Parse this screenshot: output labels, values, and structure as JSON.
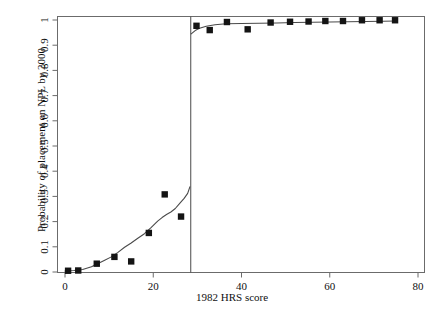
{
  "figure": {
    "background": "#ffffff",
    "axis_color": "#6b6b6b",
    "marker_color": "#141414",
    "curve_color": "#4a4a4a",
    "cutoff_line_color": "#4a4a4a"
  },
  "axes": {
    "x_title": "1982 HRS score",
    "y_title": "Probability of placement on NPL by 2000",
    "x_ticks": [
      "0",
      "20",
      "40",
      "60",
      "80"
    ],
    "y_ticks": [
      "0",
      "0.1",
      "0.2",
      "0.3",
      "0.4",
      "0.5",
      "0.6",
      "0.7",
      "0.8",
      "0.9",
      "1"
    ]
  },
  "chart_data": {
    "type": "scatter",
    "title": "",
    "xlabel": "1982 HRS score",
    "ylabel": "Probability of placement on NPL by 2000",
    "xlim": [
      -1.5,
      81
    ],
    "ylim": [
      -0.03,
      1.02
    ],
    "grid": false,
    "legend": null,
    "x_ticks": [
      0,
      20,
      40,
      60,
      80
    ],
    "y_ticks": [
      0,
      0.1,
      0.2,
      0.3,
      0.4,
      0.5,
      0.6,
      0.7,
      0.8,
      0.9,
      1
    ],
    "annotations": [
      {
        "type": "vline",
        "x": 28.5,
        "label": "HRS cutoff 28.5"
      }
    ],
    "series": [
      {
        "name": "Binned observed proportions",
        "type": "scatter",
        "marker": "square",
        "points": [
          {
            "x": 0.7,
            "y": 0.005
          },
          {
            "x": 3.0,
            "y": 0.006
          },
          {
            "x": 7.2,
            "y": 0.033
          },
          {
            "x": 11.2,
            "y": 0.06
          },
          {
            "x": 15.0,
            "y": 0.042
          },
          {
            "x": 19.0,
            "y": 0.155
          },
          {
            "x": 22.6,
            "y": 0.308
          },
          {
            "x": 26.3,
            "y": 0.22
          },
          {
            "x": 29.8,
            "y": 0.977
          },
          {
            "x": 32.8,
            "y": 0.96
          },
          {
            "x": 36.7,
            "y": 0.992
          },
          {
            "x": 41.4,
            "y": 0.963
          },
          {
            "x": 46.6,
            "y": 0.99
          },
          {
            "x": 51.0,
            "y": 0.993
          },
          {
            "x": 55.2,
            "y": 0.994
          },
          {
            "x": 59.0,
            "y": 0.996
          },
          {
            "x": 63.0,
            "y": 0.996
          },
          {
            "x": 67.3,
            "y": 0.999
          },
          {
            "x": 71.3,
            "y": 0.999
          },
          {
            "x": 74.8,
            "y": 0.999
          }
        ]
      },
      {
        "name": "Fitted probability curve (left of cutoff)",
        "type": "line",
        "points": [
          {
            "x": 0.0,
            "y": 0.004
          },
          {
            "x": 2.0,
            "y": 0.006
          },
          {
            "x": 4.0,
            "y": 0.01
          },
          {
            "x": 6.0,
            "y": 0.021
          },
          {
            "x": 7.5,
            "y": 0.034
          },
          {
            "x": 9.0,
            "y": 0.047
          },
          {
            "x": 10.5,
            "y": 0.06
          },
          {
            "x": 12.0,
            "y": 0.078
          },
          {
            "x": 13.5,
            "y": 0.098
          },
          {
            "x": 15.0,
            "y": 0.115
          },
          {
            "x": 16.5,
            "y": 0.134
          },
          {
            "x": 18.0,
            "y": 0.152
          },
          {
            "x": 19.5,
            "y": 0.176
          },
          {
            "x": 21.0,
            "y": 0.202
          },
          {
            "x": 22.0,
            "y": 0.216
          },
          {
            "x": 23.0,
            "y": 0.228
          },
          {
            "x": 24.0,
            "y": 0.238
          },
          {
            "x": 25.0,
            "y": 0.252
          },
          {
            "x": 26.0,
            "y": 0.272
          },
          {
            "x": 27.0,
            "y": 0.292
          },
          {
            "x": 27.8,
            "y": 0.312
          },
          {
            "x": 28.3,
            "y": 0.338
          }
        ]
      },
      {
        "name": "Fitted probability curve (right of cutoff)",
        "type": "line",
        "points": [
          {
            "x": 28.6,
            "y": 0.945
          },
          {
            "x": 29.5,
            "y": 0.958
          },
          {
            "x": 30.5,
            "y": 0.967
          },
          {
            "x": 32.0,
            "y": 0.975
          },
          {
            "x": 34.0,
            "y": 0.981
          },
          {
            "x": 36.5,
            "y": 0.985
          },
          {
            "x": 40.0,
            "y": 0.986
          },
          {
            "x": 44.0,
            "y": 0.987
          },
          {
            "x": 48.0,
            "y": 0.988
          },
          {
            "x": 52.0,
            "y": 0.99
          },
          {
            "x": 56.0,
            "y": 0.991
          },
          {
            "x": 60.0,
            "y": 0.992
          },
          {
            "x": 64.0,
            "y": 0.993
          },
          {
            "x": 68.0,
            "y": 0.994
          },
          {
            "x": 72.0,
            "y": 0.995
          },
          {
            "x": 75.0,
            "y": 0.996
          }
        ]
      }
    ]
  }
}
